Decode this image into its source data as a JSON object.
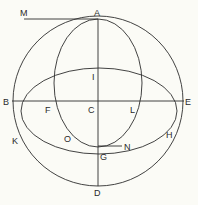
{
  "diagram": {
    "type": "geometric construction",
    "colors": {
      "background": "#fbfbf6",
      "line": "#2e2e2e",
      "text": "#2a2a2a"
    },
    "shapes": {
      "outer_circle": {
        "cx": 98,
        "cy": 101,
        "r": 85
      },
      "vertical_ellipse": {
        "cx": 98,
        "cy": 83,
        "rx": 48,
        "ry": 64
      },
      "horizontal_ellipse": {
        "cx": 98,
        "cy": 110,
        "rx": 78,
        "ry": 42
      },
      "lines": [
        {
          "name": "MA",
          "from": "M",
          "to": "A"
        },
        {
          "name": "AD",
          "from": "A",
          "to": "D"
        },
        {
          "name": "BE",
          "from": "B",
          "to": "E"
        },
        {
          "name": "GN",
          "from": "G",
          "to": "N"
        }
      ]
    },
    "labels": {
      "M": "M",
      "A": "A",
      "I": "I",
      "B": "B",
      "F": "F",
      "C": "C",
      "L": "L",
      "E": "E",
      "K": "K",
      "O": "O",
      "H": "H",
      "G": "G",
      "N": "N",
      "D": "D"
    }
  }
}
